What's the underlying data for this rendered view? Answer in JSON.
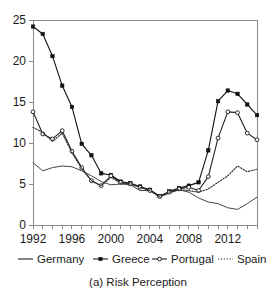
{
  "chart_data": {
    "type": "line",
    "title": "",
    "caption": "(a) Risk Perception",
    "xlabel": "",
    "ylabel": "",
    "xlim": [
      1992,
      2015
    ],
    "ylim": [
      0,
      25
    ],
    "grid": false,
    "legend_position": "bottom",
    "y_ticks": [
      0,
      5,
      10,
      15,
      20,
      25
    ],
    "y_tick_labels": [
      "0",
      "5",
      "10",
      "15",
      "20",
      "25"
    ],
    "x_ticks": [
      1992,
      1993,
      1994,
      1995,
      1996,
      1997,
      1998,
      1999,
      2000,
      2001,
      2002,
      2003,
      2004,
      2005,
      2006,
      2007,
      2008,
      2009,
      2010,
      2011,
      2012,
      2013,
      2014,
      2015
    ],
    "x_tick_labels_shown": [
      "1992",
      "1996",
      "2000",
      "2004",
      "2008",
      "2012"
    ],
    "x_tick_labels_shown_values": [
      1992,
      1996,
      2000,
      2004,
      2008,
      2012
    ],
    "x": [
      1992,
      1993,
      1994,
      1995,
      1996,
      1997,
      1998,
      1999,
      2000,
      2001,
      2002,
      2003,
      2004,
      2005,
      2006,
      2007,
      2008,
      2009,
      2010,
      2011,
      2012,
      2013,
      2014,
      2015
    ],
    "series": [
      {
        "name": "Germany",
        "style": "solid-line",
        "marker": "none",
        "color": "#444444",
        "values": [
          7.6,
          6.6,
          7.0,
          7.2,
          7.1,
          6.6,
          6.0,
          5.3,
          4.9,
          5.0,
          4.9,
          4.2,
          4.2,
          3.4,
          3.9,
          4.3,
          4.0,
          3.3,
          2.8,
          2.6,
          2.1,
          1.9,
          2.6,
          3.4
        ]
      },
      {
        "name": "Greece",
        "style": "solid-line-filled-square",
        "marker": "filled-square",
        "color": "#111111",
        "values": [
          24.2,
          23.3,
          20.6,
          17.0,
          14.4,
          9.9,
          8.5,
          6.3,
          6.1,
          5.3,
          5.1,
          4.7,
          4.3,
          3.5,
          4.1,
          4.5,
          4.8,
          5.2,
          9.1,
          15.1,
          16.4,
          16.0,
          14.7,
          13.4
        ]
      },
      {
        "name": "Portugal",
        "style": "solid-line-open-circle",
        "marker": "open-circle",
        "color": "#222222",
        "values": [
          13.8,
          11.1,
          10.5,
          11.5,
          9.0,
          7.0,
          5.4,
          4.8,
          6.0,
          5.2,
          5.0,
          4.6,
          4.2,
          3.5,
          4.0,
          4.4,
          4.6,
          4.2,
          5.9,
          10.6,
          13.8,
          13.7,
          11.2,
          10.4
        ]
      },
      {
        "name": "Spain",
        "style": "dotted-line",
        "marker": "none",
        "color": "#333333",
        "values": [
          11.9,
          11.3,
          10.2,
          11.2,
          8.8,
          6.9,
          5.4,
          4.8,
          5.8,
          5.1,
          5.0,
          4.6,
          4.2,
          3.5,
          4.0,
          4.3,
          4.2,
          4.0,
          4.4,
          5.2,
          6.0,
          7.2,
          6.5,
          6.8
        ]
      }
    ],
    "legend": [
      {
        "label": "Germany",
        "swatch": "line"
      },
      {
        "label": "Greece",
        "swatch": "line-filled-square"
      },
      {
        "label": "Portugal",
        "swatch": "line-open-circle"
      },
      {
        "label": "Spain",
        "swatch": "dotted"
      }
    ]
  }
}
